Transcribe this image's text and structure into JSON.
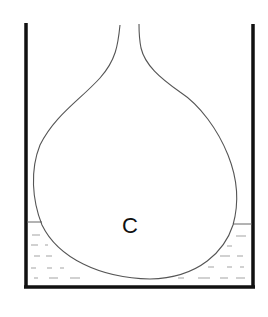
{
  "diagram": {
    "type": "flask-in-container",
    "labels": {
      "bulb": "C"
    },
    "parts": [
      "container",
      "flask-neck",
      "flask-bulb",
      "liquid"
    ],
    "colors": {
      "background": "#ffffff",
      "container_wall": "#111111",
      "flask_outline": "#555555",
      "liquid_dash": "#888888",
      "label": "#111111"
    }
  }
}
